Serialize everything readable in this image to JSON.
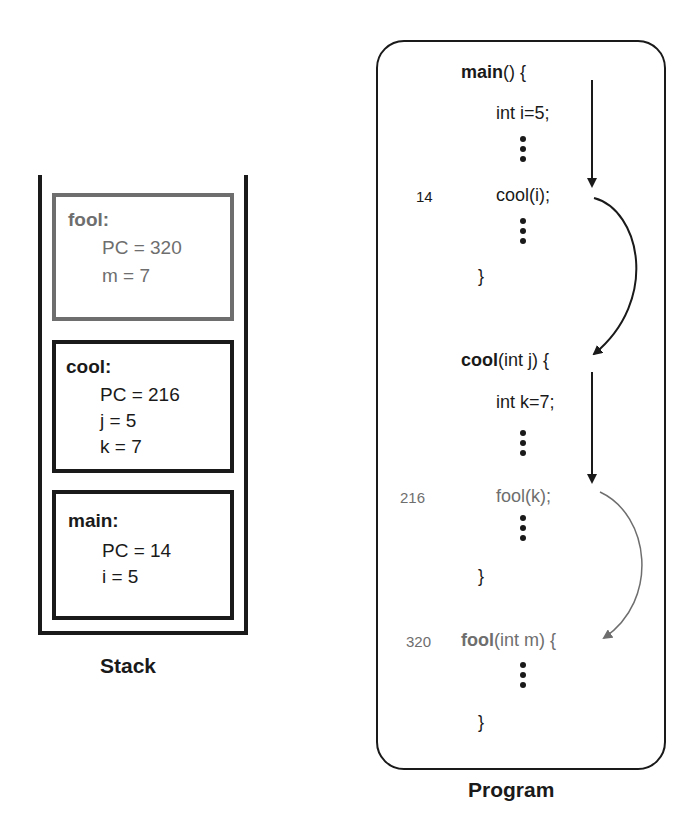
{
  "stack": {
    "label": "Stack",
    "frames": [
      {
        "name": "fool:",
        "lines": [
          "PC = 320",
          "m = 7"
        ],
        "style": "gray"
      },
      {
        "name": "cool:",
        "lines": [
          "PC = 216",
          "j = 5",
          "k = 7"
        ],
        "style": "dark"
      },
      {
        "name": "main:",
        "lines": [
          "PC = 14",
          "i = 5"
        ],
        "style": "dark"
      }
    ]
  },
  "program": {
    "label": "Program",
    "functions": [
      {
        "header_bold": "main",
        "header_rest": "() {",
        "body": [
          "int i=5;"
        ],
        "call": {
          "line_number": "14",
          "text": "cool(i);"
        },
        "close": "}"
      },
      {
        "header_bold": "cool",
        "header_rest": "(int j) {",
        "body": [
          "int k=7;"
        ],
        "call": {
          "line_number": "216",
          "text": "fool(k);"
        },
        "close": "}"
      },
      {
        "line_number": "320",
        "header_bold": "fool",
        "header_rest": "(int m) {",
        "close": "}"
      }
    ]
  },
  "colors": {
    "ink": "#1a1a1a",
    "gray": "#6e6e6e"
  }
}
